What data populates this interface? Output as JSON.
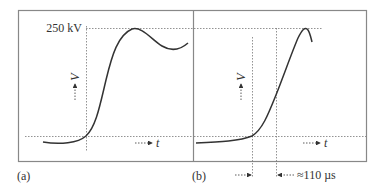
{
  "figure": {
    "panels": [
      {
        "label": "(a)",
        "peak_label": "250 kV",
        "y_axis_label": "V",
        "x_axis_label": "t"
      },
      {
        "label": "(b)",
        "y_axis_label": "V",
        "x_axis_label": "t",
        "interval_label": "≈110 µs"
      }
    ],
    "colors": {
      "frame": "#777777",
      "curve": "#333333",
      "guide": "#777777",
      "text": "#333333"
    }
  }
}
